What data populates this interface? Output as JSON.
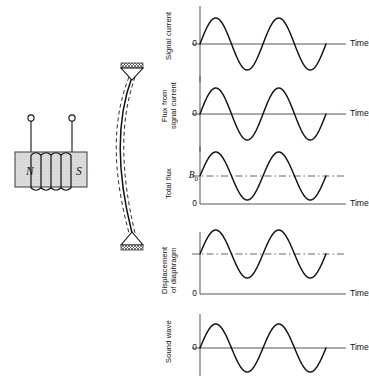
{
  "figure": {
    "background_color": "#ffffff",
    "ink_color": "#111111",
    "width": 369,
    "height": 376
  },
  "apparatus": {
    "name": "magnet-coil-diaphragm-assembly",
    "magnet": {
      "label_north": "N",
      "label_south": "S",
      "fill_color": "#dcdcdc",
      "stroke_color": "#3a3a3a"
    },
    "coil": {
      "turns": 5,
      "stroke_color": "#111111"
    },
    "terminals": {
      "count": 2,
      "marker": "open-circle"
    },
    "diaphragm": {
      "solid_curve": "rest-position",
      "dashed_curves": "displaced-positions",
      "dash_pattern": "4 3"
    },
    "supports": {
      "count": 2,
      "shape": "triangle-with-hatched-cap"
    }
  },
  "chart_data": [
    {
      "type": "line",
      "name": "signal-current",
      "ylabel": "Signal current",
      "xlabel": "Time",
      "yticks": [
        {
          "label": "0",
          "value": 0
        }
      ],
      "baseline_value": 0,
      "baseline_style": "solid",
      "reference_line": null,
      "wave": {
        "form": "sine",
        "cycles": 2,
        "amplitude": 1,
        "offset": 0,
        "phase_deg": 0
      },
      "grid": false,
      "legend": null
    },
    {
      "type": "line",
      "name": "flux-from-signal-current",
      "ylabel": "Flux from\nsignal current",
      "xlabel": "Time",
      "yticks": [
        {
          "label": "0",
          "value": 0
        }
      ],
      "baseline_value": 0,
      "baseline_style": "solid",
      "reference_line": null,
      "wave": {
        "form": "sine",
        "cycles": 2,
        "amplitude": 1,
        "offset": 0,
        "phase_deg": 0
      },
      "grid": false,
      "legend": null
    },
    {
      "type": "line",
      "name": "total-flux",
      "ylabel": "Total flux",
      "xlabel": "Time",
      "yticks": [
        {
          "label": "B",
          "sub": "0",
          "value": 1
        },
        {
          "label": "0",
          "value": 0
        }
      ],
      "baseline_value": 0,
      "baseline_style": "solid",
      "reference_line": {
        "label": "B0",
        "value": 1,
        "style": "dash-dot"
      },
      "wave": {
        "form": "sine",
        "cycles": 2,
        "amplitude": 1,
        "offset": 1,
        "phase_deg": 0
      },
      "grid": false,
      "legend": null
    },
    {
      "type": "line",
      "name": "displacement-of-diaphragm",
      "ylabel": "Displacement\nof diaphragm",
      "xlabel": "Time",
      "yticks": [
        {
          "label": "0",
          "value": 0
        }
      ],
      "baseline_value": 0,
      "baseline_style": "solid",
      "reference_line": {
        "label": "",
        "value": 1,
        "style": "dash-dot"
      },
      "wave": {
        "form": "sine",
        "cycles": 2,
        "amplitude": 1,
        "offset": 1,
        "phase_deg": 0
      },
      "grid": false,
      "legend": null
    },
    {
      "type": "line",
      "name": "sound-wave",
      "ylabel": "Sound wave",
      "xlabel": "Time",
      "yticks": [
        {
          "label": "0",
          "value": 0
        }
      ],
      "baseline_value": 0,
      "baseline_style": "solid",
      "reference_line": null,
      "wave": {
        "form": "sine",
        "cycles": 2,
        "amplitude": 1,
        "offset": 0,
        "phase_deg": 0
      },
      "grid": false,
      "legend": null
    }
  ]
}
